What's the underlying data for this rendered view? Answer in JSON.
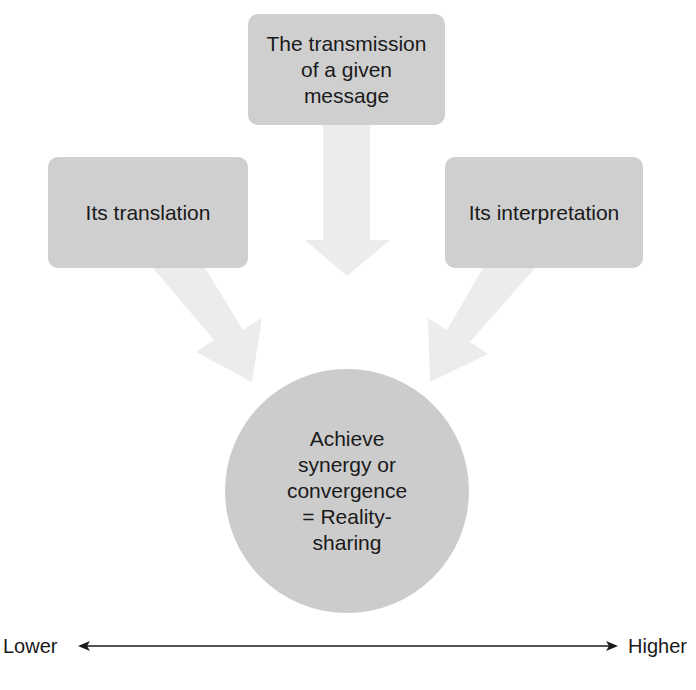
{
  "diagram": {
    "inputs": [
      {
        "id": "top",
        "label": "The transmission\nof a given\nmessage"
      },
      {
        "id": "left",
        "label": "Its translation"
      },
      {
        "id": "right",
        "label": "Its interpretation"
      }
    ],
    "outcome": {
      "label": "Achieve\nsynergy or\nconvergence\n= Reality-\nsharing"
    },
    "scale": {
      "low_label": "Lower",
      "high_label": "Higher"
    },
    "colors": {
      "box_fill": "#cfcfcf",
      "circle_fill": "#cccccc",
      "arrow_fill": "#ececec",
      "text": "#1a1a1a",
      "scale_line": "#1a1a1a"
    }
  }
}
